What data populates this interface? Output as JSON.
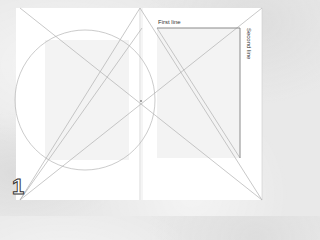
{
  "diagram": {
    "type": "page-layout-construction",
    "page_number": "1",
    "labels": {
      "first_line": "First line",
      "second_line": "Second line"
    },
    "colors": {
      "background": "#e9e9e9",
      "page": "#ffffff",
      "text_block": "#f2f2f2",
      "construction_line": "#b5b5b5",
      "emphasis_line": "#8a8a8a"
    }
  }
}
